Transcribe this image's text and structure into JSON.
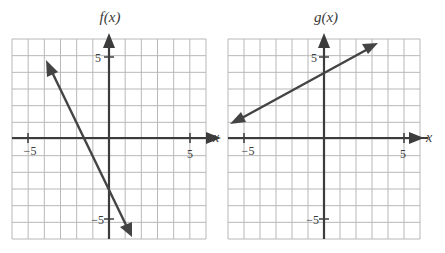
{
  "chart_data": [
    {
      "type": "line",
      "title": "f(x)",
      "xlabel": "x",
      "ylabel": "f(x)",
      "xlim": [
        -6,
        6
      ],
      "ylim": [
        -6,
        6
      ],
      "grid": true,
      "tick_labels": {
        "x": [
          "-5",
          "5"
        ],
        "y": [
          "5",
          "-5"
        ]
      },
      "equation": "f(x) = -2x - 3",
      "series": [
        {
          "name": "f(x)",
          "x": [
            -3.8,
            1.5
          ],
          "y": [
            4.6,
            -6.0
          ],
          "arrows": "both"
        }
      ],
      "notes": "Line through (0, -3) and (-1.5, 0); slope -2"
    },
    {
      "type": "line",
      "title": "g(x)",
      "xlabel": "x",
      "ylabel": "g(x)",
      "xlim": [
        -6,
        6
      ],
      "ylim": [
        -6,
        6
      ],
      "grid": true,
      "tick_labels": {
        "x": [
          "-5",
          "5"
        ],
        "y": [
          "5",
          "-5"
        ]
      },
      "equation": "g(x) = 0.5x + 4",
      "series": [
        {
          "name": "g(x)",
          "x": [
            -5.8,
            3.3
          ],
          "y": [
            1.1,
            5.65
          ],
          "arrows": "both"
        }
      ],
      "notes": "Line through (0, 4); slope 1/2"
    }
  ],
  "plots": {
    "left": {
      "title": "f(x)",
      "x_axis_label": "x",
      "tick_x_neg": "−5",
      "tick_x_pos": "5",
      "tick_y_pos": "5",
      "tick_y_neg": "−5"
    },
    "right": {
      "title": "g(x)",
      "x_axis_label": "x",
      "tick_x_neg": "−5",
      "tick_x_pos": "5",
      "tick_y_pos": "5",
      "tick_y_neg": "−5"
    }
  },
  "colors": {
    "grid": "#b8b8b8",
    "axis": "#3c3c3c",
    "line": "#444444",
    "text": "#3a3a3a"
  }
}
